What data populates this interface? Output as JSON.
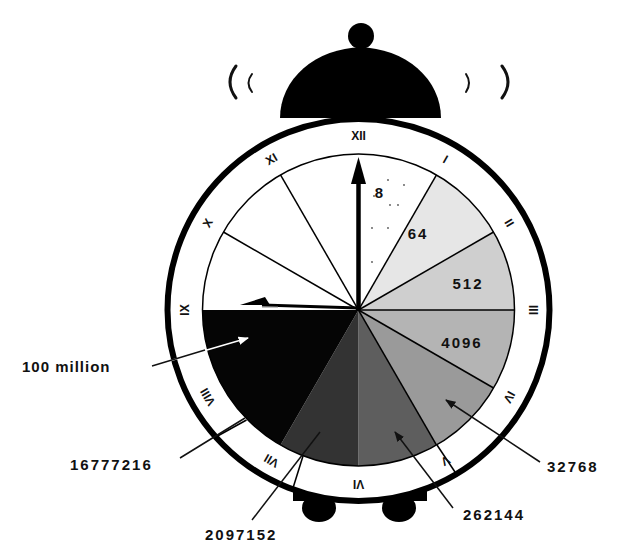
{
  "diagram": {
    "numerals": [
      "XII",
      "I",
      "II",
      "III",
      "IV",
      "V",
      "VI",
      "VII",
      "VIII",
      "IX",
      "X",
      "XI"
    ],
    "sectors": [
      {
        "from_hour": 0,
        "to_hour": 1,
        "fill": "#ffffff",
        "label": "8",
        "label_pos": [
          380,
          192
        ]
      },
      {
        "from_hour": 1,
        "to_hour": 2,
        "fill": "#e6e6e6",
        "label": "64",
        "label_pos": [
          418,
          233
        ]
      },
      {
        "from_hour": 2,
        "to_hour": 3,
        "fill": "#cfcfcf",
        "label": "512",
        "label_pos": [
          468,
          283
        ]
      },
      {
        "from_hour": 3,
        "to_hour": 4,
        "fill": "#b4b4b4",
        "label": "4096",
        "label_pos": [
          462,
          342
        ]
      },
      {
        "from_hour": 4,
        "to_hour": 5,
        "fill": "#9a9a9a",
        "label": "",
        "label_pos": [
          0,
          0
        ]
      },
      {
        "from_hour": 5,
        "to_hour": 6,
        "fill": "#5e5e5e",
        "label": "",
        "label_pos": [
          0,
          0
        ]
      },
      {
        "from_hour": 6,
        "to_hour": 7,
        "fill": "#333333",
        "label": "",
        "label_pos": [
          0,
          0
        ]
      },
      {
        "from_hour": 7,
        "to_hour": 9,
        "fill": "#050505",
        "label": "",
        "label_pos": [
          0,
          0
        ]
      },
      {
        "from_hour": 9,
        "to_hour": 12,
        "fill": "#ffffff",
        "label": "",
        "label_pos": [
          0,
          0
        ]
      }
    ],
    "callouts": [
      {
        "text": "100 million",
        "text_pos": [
          22,
          372
        ],
        "line": [
          [
            152,
            366
          ],
          [
            248,
            338
          ]
        ],
        "arrow": true
      },
      {
        "text": "16777216",
        "text_pos": [
          70,
          470
        ],
        "line": [
          [
            180,
            458
          ],
          [
            245,
            418
          ]
        ],
        "arrow": false
      },
      {
        "text": "2097152",
        "text_pos": [
          205,
          540
        ],
        "line": [
          [
            252,
            520
          ],
          [
            320,
            432
          ]
        ],
        "arrow": false
      },
      {
        "text": "262144",
        "text_pos": [
          463,
          520
        ],
        "line": [
          [
            453,
            508
          ],
          [
            395,
            432
          ]
        ],
        "arrow": true
      },
      {
        "text": "32768",
        "text_pos": [
          547,
          472
        ],
        "line": [
          [
            540,
            462
          ],
          [
            446,
            400
          ]
        ],
        "arrow": true
      }
    ],
    "time_shown": {
      "hour_hand": "XII",
      "minute_hand": "IX"
    },
    "colors": {
      "ink": "#000000",
      "background": "#ffffff"
    }
  }
}
